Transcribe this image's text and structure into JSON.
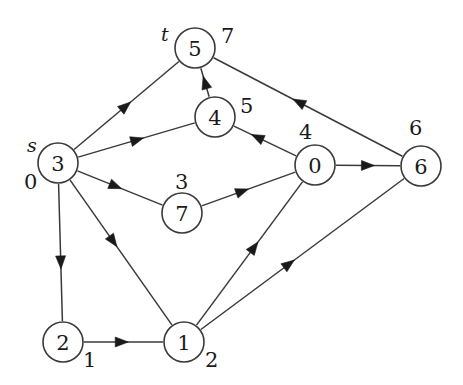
{
  "figure": {
    "type": "directed-graph",
    "title": "",
    "background_color": "#ffffff",
    "stroke_color": "#3a3a3a",
    "text_color": "#1a1a1a",
    "node_radius": 20
  },
  "nodes": [
    {
      "id": "5",
      "label": "5",
      "cx": 195,
      "cy": 48
    },
    {
      "id": "4",
      "label": "4",
      "cx": 215,
      "cy": 117
    },
    {
      "id": "3",
      "label": "3",
      "cx": 58,
      "cy": 163
    },
    {
      "id": "0",
      "label": "0",
      "cx": 315,
      "cy": 165
    },
    {
      "id": "6",
      "label": "6",
      "cx": 421,
      "cy": 166
    },
    {
      "id": "7",
      "label": "7",
      "cx": 182,
      "cy": 213
    },
    {
      "id": "2",
      "label": "2",
      "cx": 63,
      "cy": 342
    },
    {
      "id": "1",
      "label": "1",
      "cx": 184,
      "cy": 342
    }
  ],
  "annotations": [
    {
      "name": "source-marker",
      "text": "s",
      "x": 27,
      "y": 136,
      "italic": true
    },
    {
      "name": "sink-marker",
      "text": "t",
      "x": 161,
      "y": 25,
      "italic": true
    },
    {
      "name": "label-node-3-index",
      "text": "0",
      "x": 24,
      "y": 172,
      "italic": false
    },
    {
      "name": "label-node-5-index",
      "text": "7",
      "x": 221,
      "y": 26,
      "italic": false
    },
    {
      "name": "label-node-4-index",
      "text": "5",
      "x": 240,
      "y": 96,
      "italic": false
    },
    {
      "name": "label-node-0-index",
      "text": "4",
      "x": 299,
      "y": 122,
      "italic": false
    },
    {
      "name": "label-node-6-index",
      "text": "6",
      "x": 409,
      "y": 118,
      "italic": false
    },
    {
      "name": "label-node-7-index",
      "text": "3",
      "x": 175,
      "y": 172,
      "italic": false
    },
    {
      "name": "label-node-2-index",
      "text": "1",
      "x": 83,
      "y": 350,
      "italic": false
    },
    {
      "name": "label-node-1-index",
      "text": "2",
      "x": 205,
      "y": 350,
      "italic": false
    }
  ],
  "edges": [
    {
      "name": "edge-3-to-5",
      "from": "3",
      "to": "5",
      "arrow_t": 0.54
    },
    {
      "name": "edge-3-to-4",
      "from": "3",
      "to": "4",
      "arrow_t": 0.56
    },
    {
      "name": "edge-3-to-7",
      "from": "3",
      "to": "7",
      "arrow_t": 0.52
    },
    {
      "name": "edge-3-to-2",
      "from": "3",
      "to": "2",
      "arrow_t": 0.62
    },
    {
      "name": "edge-3-to-1",
      "from": "3",
      "to": "1",
      "arrow_t": 0.46
    },
    {
      "name": "edge-4-to-5",
      "from": "4",
      "to": "5",
      "arrow_t": 0.72
    },
    {
      "name": "edge-6-to-5",
      "from": "6",
      "to": "5",
      "arrow_t": 0.58
    },
    {
      "name": "edge-0-to-4",
      "from": "0",
      "to": "4",
      "arrow_t": 0.72
    },
    {
      "name": "edge-0-to-6",
      "from": "0",
      "to": "6",
      "arrow_t": 0.6
    },
    {
      "name": "edge-7-to-0",
      "from": "7",
      "to": "0",
      "arrow_t": 0.5
    },
    {
      "name": "edge-1-to-0",
      "from": "1",
      "to": "0",
      "arrow_t": 0.58
    },
    {
      "name": "edge-1-to-6",
      "from": "1",
      "to": "6",
      "arrow_t": 0.46
    },
    {
      "name": "edge-2-to-1",
      "from": "2",
      "to": "1",
      "arrow_t": 0.56
    }
  ]
}
